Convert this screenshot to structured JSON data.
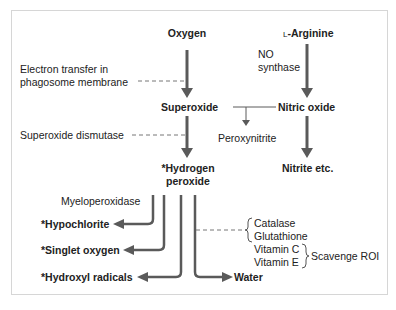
{
  "nodes": {
    "oxygen": "Oxygen",
    "l_arginine": "L-Arginine",
    "superoxide": "Superoxide",
    "nitric_oxide": "Nitric oxide",
    "peroxynitrite": "Peroxynitrite",
    "hydrogen_peroxide_line1": "*Hydrogen",
    "hydrogen_peroxide_line2": "peroxide",
    "nitrite": "Nitrite etc.",
    "hypochlorite": "*Hypochlorite",
    "singlet_oxygen": "*Singlet oxygen",
    "hydroxyl_radicals": "*Hydroxyl radicals",
    "water": "Water"
  },
  "labels": {
    "electron_transfer_line1": "Electron transfer in",
    "electron_transfer_line2": "phagosome membrane",
    "superoxide_dismutase": "Superoxide dismutase",
    "no_synthase_line1": "NO",
    "no_synthase_line2": "synthase",
    "myeloperoxidase": "Myeloperoxidase"
  },
  "scavengers": {
    "items": [
      "Catalase",
      "Glutathione",
      "Vitamin C",
      "Vitamin E"
    ],
    "group_label": "Scavenge ROI"
  },
  "colors": {
    "arrow": "#5a5a5a",
    "dashed": "#777777",
    "border": "#d6d6d6"
  }
}
